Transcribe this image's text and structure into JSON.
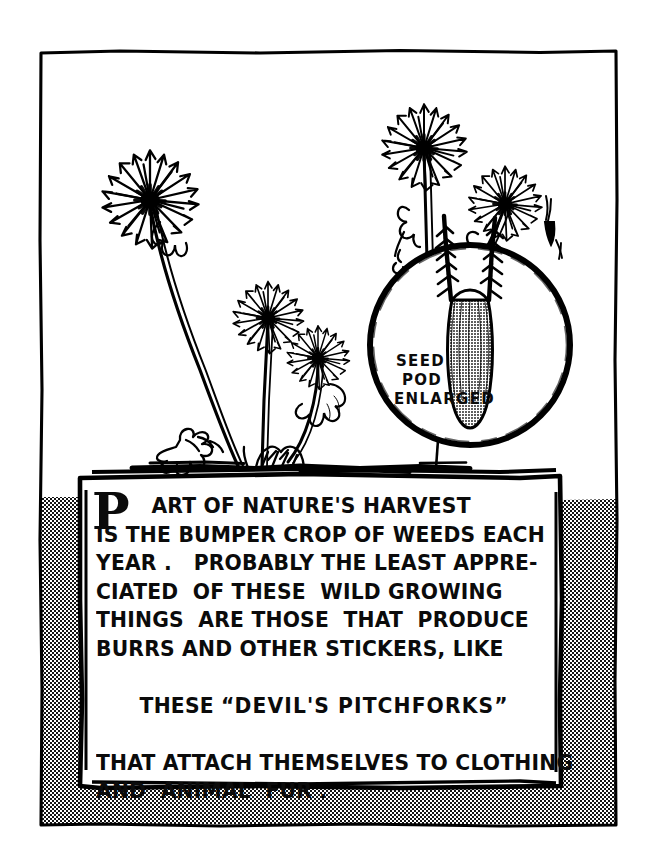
{
  "illustration": {
    "title": "Dandelion weeds with enlarged seed pod inset",
    "style": "black-ink pen drawing on white, halftone gray frame band",
    "colors": {
      "ink": "#000000",
      "paper": "#ffffff",
      "halftone_gray": "#9a9a9a",
      "pod_fill_gray": "#8e8e8e"
    }
  },
  "inset": {
    "name": "seed-pod-inset",
    "label_lines": [
      "SEED",
      "POD",
      "ENLARGED"
    ]
  },
  "caption": {
    "dropcap": "P",
    "lines": [
      "ART OF NATURE'S HARVEST",
      "IS THE BUMPER CROP OF WEEDS EACH",
      "YEAR .   PROBABLY THE LEAST APPRE-",
      "CIATED  OF THESE  WILD GROWING",
      "THINGS  ARE THOSE  THAT  PRODUCE",
      "BURRS AND OTHER STICKERS, LIKE",
      "THESE “DEVIL'S PITCHFORKS”",
      "THAT ATTACH THEMSELVES TO CLOTHING",
      "AND  ANIMAL  FUR ."
    ],
    "bold_phrase": "DEVIL'S PITCHFORKS",
    "full_text": "PART OF NATURE'S HARVEST IS THE BUMPER CROP OF WEEDS EACH YEAR. PROBABLY THE LEAST APPRECIATED OF THESE WILD GROWING THINGS ARE THOSE THAT PRODUCE BURRS AND OTHER STICKERS, LIKE THESE “DEVIL'S PITCHFORKS” THAT ATTACH THEMSELVES TO CLOTHING AND ANIMAL FUR ."
  },
  "elements": {
    "outer_frame": "hand-drawn rectangular ink border",
    "gray_band": "halftone gray band along lower left, bottom and right inside the frame",
    "text_panel": "white hand-drawn rectangle containing the caption",
    "plants": [
      {
        "name": "dandelion-left",
        "note": "large seed head on long curving stem, leaning left"
      },
      {
        "name": "dandelion-tall-right",
        "note": "tallest upright seed head, center right"
      },
      {
        "name": "dandelion-mid",
        "note": "medium seed head center"
      },
      {
        "name": "dandelion-small",
        "note": "small seed head right of center with curling leaf"
      },
      {
        "name": "dandelion-far-right",
        "note": "seed head at upper right above inset circle"
      }
    ],
    "detached_seeds": 3,
    "ground_line": "horizontal ink ground with clumps and root leaves"
  }
}
